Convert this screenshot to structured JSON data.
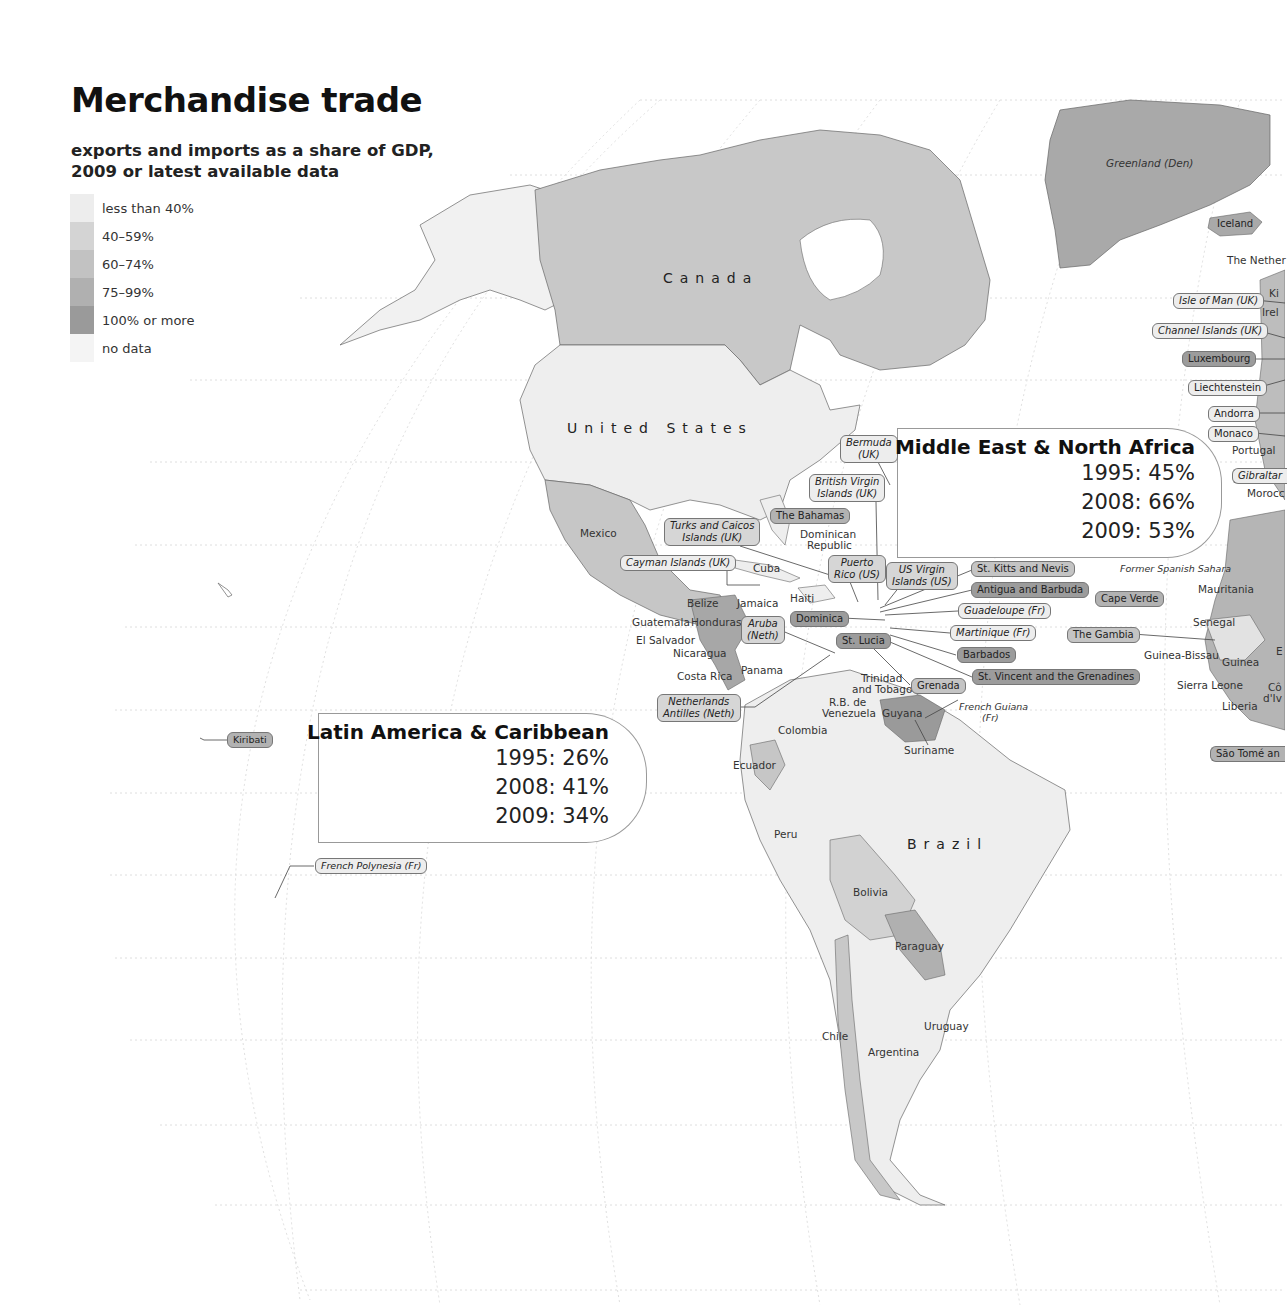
{
  "header": {
    "title": "Merchandise trade",
    "subtitle_line1": "exports and imports as a share of GDP,",
    "subtitle_line2": "2009 or latest available data"
  },
  "legend": {
    "items": [
      {
        "label": "less than 40%",
        "color": "#ededed"
      },
      {
        "label": "40–59%",
        "color": "#d4d4d4"
      },
      {
        "label": "60–74%",
        "color": "#c2c2c2"
      },
      {
        "label": "75–99%",
        "color": "#b0b0b0"
      },
      {
        "label": "100% or more",
        "color": "#9a9a9a"
      },
      {
        "label": "no data",
        "color": "#f4f4f4"
      }
    ]
  },
  "callouts": {
    "mena": {
      "title": "Middle East & North Africa",
      "v1995": "1995: 45%",
      "v2008": "2008: 66%",
      "v2009": "2009: 53%"
    },
    "lac": {
      "title": "Latin America & Caribbean",
      "v1995": "1995: 26%",
      "v2008": "2008: 41%",
      "v2009": "2009: 34%"
    }
  },
  "countries": {
    "canada": "Canada",
    "united_states": "United States",
    "brazil": "Brazil",
    "greenland": "Greenland (Den)",
    "mexico": "Mexico",
    "cuba": "Cuba",
    "jamaica": "Jamaica",
    "haiti": "Haiti",
    "dominican_republic_1": "Dominican",
    "dominican_republic_2": "Republic",
    "belize": "Belize",
    "guatemala": "Guatemala",
    "honduras": "Honduras",
    "el_salvador": "El Salvador",
    "nicaragua": "Nicaragua",
    "costa_rica": "Costa Rica",
    "panama": "Panama",
    "trinidad_1": "Trinidad",
    "trinidad_2": "and Tobago",
    "venezuela_1": "R.B. de",
    "venezuela_2": "Venezuela",
    "guyana": "Guyana",
    "suriname": "Suriname",
    "french_guiana_1": "French Guiana",
    "french_guiana_2": "(Fr)",
    "colombia": "Colombia",
    "ecuador": "Ecuador",
    "peru": "Peru",
    "bolivia": "Bolivia",
    "paraguay": "Paraguay",
    "chile": "Chile",
    "argentina": "Argentina",
    "uruguay": "Uruguay",
    "netherlands_cut": "The Nether",
    "ki_cut": "Ki",
    "ireland_cut": "Irel",
    "portugal": "Portugal",
    "morocco_cut": "Morocc",
    "former_spanish_sahara": "Former Spanish Sahara",
    "mauritania": "Mauritania",
    "senegal": "Senegal",
    "guinea_bissau": "Guinea-Bissau",
    "guinea": "Guinea",
    "sierra_leone": "Sierra Leone",
    "liberia": "Liberia",
    "cote_cut_1": "Cô",
    "cote_cut_2": "d'Iv",
    "e_cut": "E"
  },
  "pills": {
    "iceland": "Iceland",
    "isle_of_man": "Isle of Man (UK)",
    "channel_islands": "Channel Islands (UK)",
    "luxembourg": "Luxembourg",
    "liechtenstein": "Liechtenstein",
    "andorra": "Andorra",
    "monaco": "Monaco",
    "gibraltar": "Gibraltar",
    "cape_verde": "Cape Verde",
    "the_gambia": "The Gambia",
    "sao_tome": "São Tomé an",
    "bermuda_1": "Bermuda",
    "bermuda_2": "(UK)",
    "bvi_1": "British Virgin",
    "bvi_2": "Islands (UK)",
    "bahamas": "The Bahamas",
    "turks_1": "Turks and Caicos",
    "turks_2": "Islands (UK)",
    "cayman": "Cayman Islands (UK)",
    "puerto_rico_1": "Puerto",
    "puerto_rico_2": "Rico (US)",
    "usvi_1": "US Virgin",
    "usvi_2": "Islands (US)",
    "st_kitts": "St. Kitts and Nevis",
    "antigua": "Antigua and Barbuda",
    "guadeloupe": "Guadeloupe (Fr)",
    "martinique": "Martinique (Fr)",
    "barbados": "Barbados",
    "st_vincent": "St. Vincent and the Grenadines",
    "grenada": "Grenada",
    "dominica": "Dominica",
    "st_lucia": "St. Lucia",
    "aruba_1": "Aruba",
    "aruba_2": "(Neth)",
    "neth_antilles_1": "Netherlands",
    "neth_antilles_2": "Antilles (Neth)",
    "kiribati": "Kiribati",
    "french_polynesia": "French Polynesia (Fr)"
  }
}
